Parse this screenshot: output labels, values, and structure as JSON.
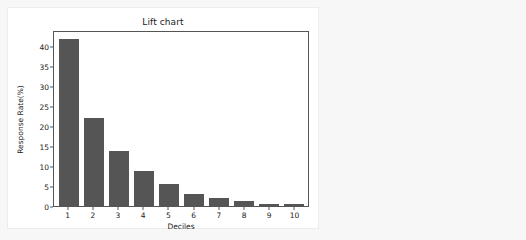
{
  "theme": {
    "page_background": "#f7f7f7",
    "card_background": "#ffffff",
    "bar_color": "#555555",
    "axis_color": "#555555",
    "text_color": "#1a1a1a"
  },
  "chart_data": {
    "type": "bar",
    "title": "Lift chart",
    "xlabel": "Deciles",
    "ylabel": "Response Rate(%)",
    "categories": [
      "1",
      "2",
      "3",
      "4",
      "5",
      "6",
      "7",
      "8",
      "9",
      "10"
    ],
    "values": [
      42.2,
      22.2,
      14.0,
      8.9,
      5.6,
      3.0,
      2.1,
      1.2,
      0.6,
      0.6
    ],
    "ylim": [
      0,
      44
    ],
    "yticks": [
      0,
      5,
      10,
      15,
      20,
      25,
      30,
      35,
      40
    ],
    "ytick_labels": [
      "0",
      "5",
      "10",
      "15",
      "20",
      "25",
      "30",
      "35",
      "40"
    ],
    "grid": false,
    "legend": null
  }
}
